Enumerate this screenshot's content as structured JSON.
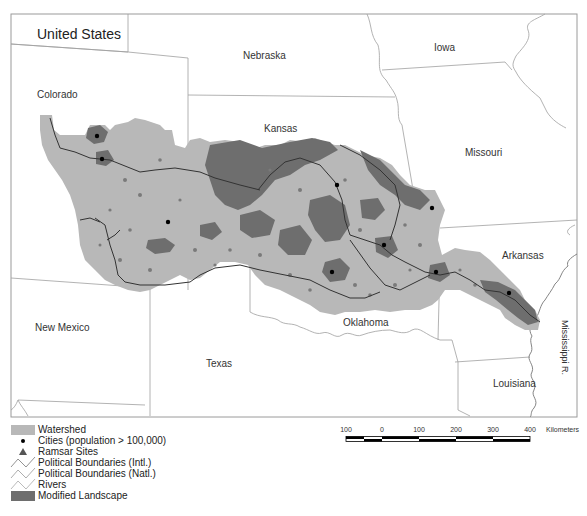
{
  "map": {
    "country_label": "United States",
    "states": [
      {
        "name": "Nebraska",
        "x": 243,
        "y": 50
      },
      {
        "name": "Iowa",
        "x": 434,
        "y": 42
      },
      {
        "name": "Colorado",
        "x": 37,
        "y": 90
      },
      {
        "name": "Kansas",
        "x": 262,
        "y": 123
      },
      {
        "name": "Missouri",
        "x": 465,
        "y": 147
      },
      {
        "name": "Arkansas",
        "x": 500,
        "y": 250
      },
      {
        "name": "Oklahoma",
        "x": 343,
        "y": 318
      },
      {
        "name": "New Mexico",
        "x": 35,
        "y": 322
      },
      {
        "name": "Texas",
        "x": 206,
        "y": 358
      },
      {
        "name": "Louisiana",
        "x": 493,
        "y": 378
      }
    ],
    "river_label": "Mississippi R.",
    "colors": {
      "watershed": "#b8b8b8",
      "modified_landscape": "#6e6e6e",
      "boundary": "#9a9a9a",
      "river": "#333333",
      "city": "#000000",
      "ramsar": "#555555"
    },
    "cities": [
      {
        "x": 97,
        "y": 136
      },
      {
        "x": 102,
        "y": 159
      },
      {
        "x": 168,
        "y": 222
      },
      {
        "x": 337,
        "y": 185
      },
      {
        "x": 432,
        "y": 208
      },
      {
        "x": 384,
        "y": 245
      },
      {
        "x": 332,
        "y": 272
      },
      {
        "x": 436,
        "y": 272
      },
      {
        "x": 509,
        "y": 293
      }
    ]
  },
  "legend": {
    "items": [
      {
        "symbol": "watershed-swatch",
        "label": "Watershed"
      },
      {
        "symbol": "city-dot",
        "label": "Cities (population > 100,000)"
      },
      {
        "symbol": "ramsar-triangle",
        "label": "Ramsar Sites"
      },
      {
        "symbol": "intl-boundary-line",
        "label": "Political Boundaries (Intl.)"
      },
      {
        "symbol": "natl-boundary-line",
        "label": "Political Boundaries (Natl.)"
      },
      {
        "symbol": "river-line",
        "label": "Rivers"
      },
      {
        "symbol": "modified-landscape-swatch",
        "label": "Modified Landscape"
      }
    ]
  },
  "scalebar": {
    "ticks": [
      "100",
      "0",
      "100",
      "200",
      "300",
      "400"
    ],
    "unit": "Kilometers"
  }
}
